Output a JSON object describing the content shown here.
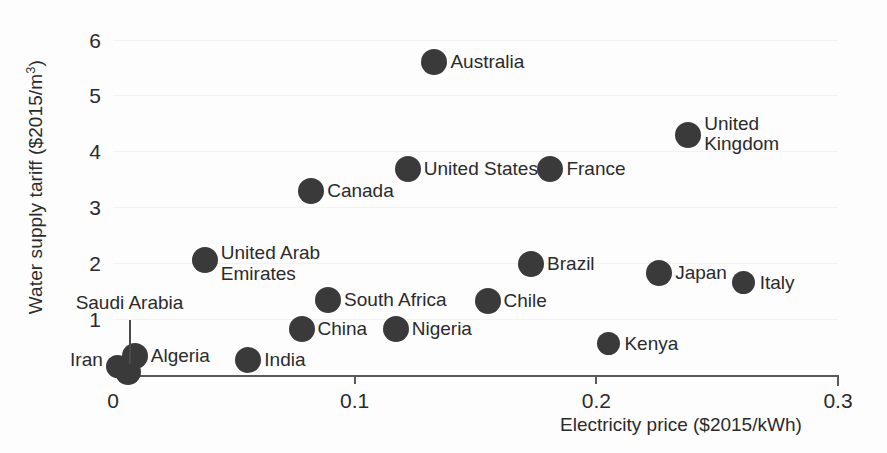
{
  "chart_data": {
    "type": "scatter",
    "title": "",
    "xlabel": "Electricity price ($2015/kWh)",
    "ylabel": "Water supply tariff ($2015/m³)",
    "xlim": [
      0,
      0.3
    ],
    "ylim": [
      0,
      6.35
    ],
    "xticks": [
      "0",
      "0.1",
      "0.2",
      "0.3"
    ],
    "xtick_values": [
      0,
      0.1,
      0.2,
      0.3
    ],
    "yticks": [
      "1",
      "2",
      "3",
      "4",
      "5",
      "6"
    ],
    "ytick_values": [
      1,
      2,
      3,
      4,
      5,
      6
    ],
    "grid": false,
    "legend": "none",
    "marker_color": "#3a3a3a",
    "points": [
      {
        "label": "Australia",
        "x": 0.133,
        "y": 5.6,
        "label_pos": "right"
      },
      {
        "label": "United Kingdom",
        "x": 0.238,
        "y": 4.3,
        "label_pos": "right"
      },
      {
        "label": "United States",
        "x": 0.122,
        "y": 3.68,
        "label_pos": "right"
      },
      {
        "label": "France",
        "x": 0.181,
        "y": 3.68,
        "label_pos": "right"
      },
      {
        "label": "Canada",
        "x": 0.082,
        "y": 3.3,
        "label_pos": "right"
      },
      {
        "label": "United Arab\nEmirates",
        "x": 0.038,
        "y": 2.05,
        "label_pos": "right"
      },
      {
        "label": "Brazil",
        "x": 0.173,
        "y": 1.98,
        "label_pos": "right"
      },
      {
        "label": "Japan",
        "x": 0.226,
        "y": 1.83,
        "label_pos": "right"
      },
      {
        "label": "Italy",
        "x": 0.261,
        "y": 1.65,
        "label_pos": "right"
      },
      {
        "label": "South Africa",
        "x": 0.089,
        "y": 1.35,
        "label_pos": "right"
      },
      {
        "label": "Chile",
        "x": 0.155,
        "y": 1.33,
        "label_pos": "right"
      },
      {
        "label": "China",
        "x": 0.078,
        "y": 0.82,
        "label_pos": "right"
      },
      {
        "label": "Nigeria",
        "x": 0.117,
        "y": 0.83,
        "label_pos": "right"
      },
      {
        "label": "Kenya",
        "x": 0.205,
        "y": 0.56,
        "label_pos": "right"
      },
      {
        "label": "India",
        "x": 0.056,
        "y": 0.26,
        "label_pos": "right"
      },
      {
        "label": "Algeria",
        "x": 0.009,
        "y": 0.34,
        "label_pos": "right"
      },
      {
        "label": "Iran",
        "x": 0.002,
        "y": 0.16,
        "label_pos": "leftof"
      },
      {
        "label": "Saudi Arabia",
        "x": 0.006,
        "y": 0.06,
        "label_pos": "leader"
      }
    ]
  },
  "axes": {
    "x_label": "Electricity price ($2015/kWh)",
    "y_label_main": "Water supply tariff ($2015/m",
    "y_label_sup": "3",
    "y_label_close": ")"
  }
}
